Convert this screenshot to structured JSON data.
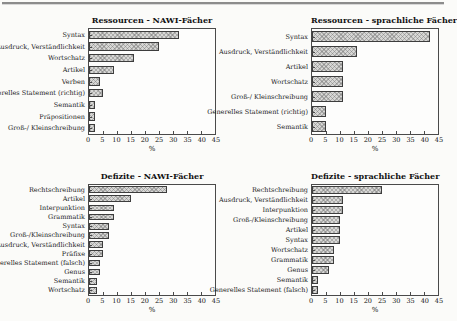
{
  "figure": {
    "type": "bar-chart-panel",
    "panel_layout": "2x2"
  },
  "chart_data": [
    {
      "type": "bar",
      "orientation": "horizontal",
      "title": "Ressourcen - NAWI-Fächer",
      "xlabel": "%",
      "xlim": [
        0,
        45
      ],
      "xticks": [
        0,
        5,
        10,
        15,
        20,
        25,
        30,
        35,
        40,
        45
      ],
      "grid": false,
      "categories": [
        "Syntax",
        "Ausdruck, Verständlichkeit",
        "Wortschatz",
        "Artikel",
        "Verben",
        "Generelles Statement (richtig)",
        "Semantik",
        "Präpositionen",
        "Groß-/ Kleinschreibung"
      ],
      "values": [
        32,
        25,
        16,
        9,
        4,
        5,
        2,
        2,
        2
      ]
    },
    {
      "type": "bar",
      "orientation": "horizontal",
      "title": "Ressourcen - sprachliche Fächer",
      "xlabel": "%",
      "xlim": [
        0,
        45
      ],
      "xticks": [
        0,
        5,
        10,
        15,
        20,
        25,
        30,
        35,
        40,
        45
      ],
      "grid": false,
      "categories": [
        "Syntax",
        "Ausdruck, Verständlichkeit",
        "Artikel",
        "Wortschatz",
        "Groß-/ Kleinschreibung",
        "Generelles Statement (richtig)",
        "Semantik"
      ],
      "values": [
        42,
        16,
        11,
        11,
        11,
        5,
        5
      ]
    },
    {
      "type": "bar",
      "orientation": "horizontal",
      "title": "Defizite - NAWI-Fächer",
      "xlabel": "%",
      "xlim": [
        0,
        45
      ],
      "xticks": [
        0,
        5,
        10,
        15,
        20,
        25,
        30,
        35,
        40,
        45
      ],
      "grid": false,
      "categories": [
        "Rechtschreibung",
        "Artikel",
        "Interpunktion",
        "Grammatik",
        "Syntax",
        "Groß-/Kleinschreibung",
        "Ausdruck, Verständlichkeit",
        "Präfixe",
        "Generelles Statement (falsch)",
        "Genus",
        "Semantik",
        "Wortschatz"
      ],
      "values": [
        28,
        15,
        9,
        9,
        7,
        7,
        5,
        5,
        4,
        4,
        3,
        3
      ]
    },
    {
      "type": "bar",
      "orientation": "horizontal",
      "title": "Defizite - sprachliche Fächer",
      "xlabel": "%",
      "xlim": [
        0,
        45
      ],
      "xticks": [
        0,
        5,
        10,
        15,
        20,
        25,
        30,
        35,
        40,
        45
      ],
      "grid": false,
      "categories": [
        "Rechtschreibung",
        "Ausdruck, Verständlichkeit",
        "Interpunktion",
        "Groß-/Kleinschreibung",
        "Artikel",
        "Syntax",
        "Wortschatz",
        "Grammatik",
        "Genus",
        "Semantik",
        "Generelles Statement (falsch)"
      ],
      "values": [
        25,
        11,
        11,
        10,
        10,
        10,
        8,
        8,
        6,
        2,
        2
      ]
    }
  ],
  "style": {
    "bar_fill": "#d7d7d5",
    "bar_pattern": "crosshatch",
    "bar_border": "#3d3d3d",
    "axis_color": "#4a4a4a",
    "rule_color": "#8c8c8c",
    "background": "#fbfbf9"
  }
}
